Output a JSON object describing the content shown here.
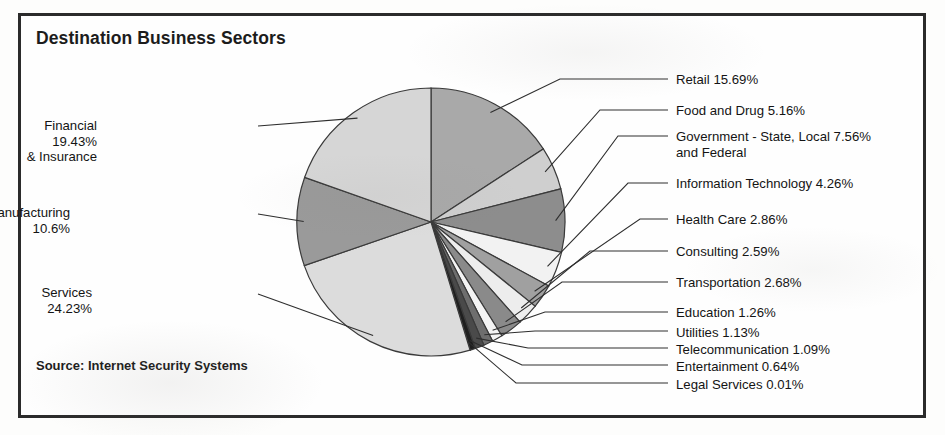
{
  "chart_data": {
    "type": "pie",
    "title": "Destination Business Sectors",
    "source": "Source: Internet Security Systems",
    "unit": "%",
    "start_angle_deg": 0,
    "direction": "clockwise",
    "legend_position": "callout-labels",
    "grid": false,
    "categories": [
      "Retail",
      "Food and Drug",
      "Government - State, Local and Federal",
      "Information Technology",
      "Health Care",
      "Consulting",
      "Transportation",
      "Education",
      "Utilities",
      "Telecommunication",
      "Entertainment",
      "Legal Services",
      "Services",
      "Manufacturing",
      "Financial & Insurance"
    ],
    "values": [
      15.69,
      5.16,
      7.56,
      4.26,
      2.86,
      2.59,
      2.68,
      1.26,
      1.13,
      1.09,
      0.64,
      0.01,
      24.23,
      10.6,
      19.43
    ],
    "slices": [
      {
        "name": "Retail",
        "value": 15.69,
        "label": "Retail 15.69%",
        "color": "#a9a9a9"
      },
      {
        "name": "Food and Drug",
        "value": 5.16,
        "label": "Food and Drug 5.16%",
        "color": "#cfcfcf"
      },
      {
        "name": "Government",
        "value": 7.56,
        "label": "Government - State, Local 7.56%\nand Federal",
        "color": "#8d8d8d"
      },
      {
        "name": "Information Technology",
        "value": 4.26,
        "label": "Information Technology 4.26%",
        "color": "#f2f2f2"
      },
      {
        "name": "Health Care",
        "value": 2.86,
        "label": "Health Care 2.86%",
        "color": "#a0a0a0"
      },
      {
        "name": "Consulting",
        "value": 2.59,
        "label": "Consulting 2.59%",
        "color": "#ededed"
      },
      {
        "name": "Transportation",
        "value": 2.68,
        "label": "Transportation 2.68%",
        "color": "#8a8a8a"
      },
      {
        "name": "Education",
        "value": 1.26,
        "label": "Education 1.26%",
        "color": "#f4f4f4"
      },
      {
        "name": "Utilities",
        "value": 1.13,
        "label": "Utilities 1.13%",
        "color": "#6e6e6e"
      },
      {
        "name": "Telecommunication",
        "value": 1.09,
        "label": "Telecommunication 1.09%",
        "color": "#4a4a4a"
      },
      {
        "name": "Entertainment",
        "value": 0.64,
        "label": "Entertainment 0.64%",
        "color": "#1f1f1f"
      },
      {
        "name": "Legal Services",
        "value": 0.01,
        "label": "Legal Services 0.01%",
        "color": "#101010"
      },
      {
        "name": "Services",
        "value": 24.23,
        "label": "Services 24.23%",
        "color": "#dcdcdc"
      },
      {
        "name": "Manufacturing",
        "value": 10.6,
        "label": "Manufacturing 10.6%",
        "color": "#9a9a9a"
      },
      {
        "name": "Financial & Insurance",
        "value": 19.43,
        "label": "Financial 19.43%\n& Insurance",
        "color": "#d6d6d6"
      }
    ]
  },
  "labels": {
    "left": [
      {
        "name": "financial-insurance",
        "text": "Financial 19.43%\n& Insurance",
        "x": 97,
        "y": 118
      },
      {
        "name": "manufacturing",
        "text": "Manufacturing 10.6%",
        "x": 70,
        "y": 205
      },
      {
        "name": "services",
        "text": "Services 24.23%",
        "x": 92,
        "y": 285
      }
    ],
    "right": [
      {
        "name": "retail",
        "text": "Retail 15.69%",
        "x": 676,
        "y": 72
      },
      {
        "name": "food-and-drug",
        "text": "Food and Drug 5.16%",
        "x": 676,
        "y": 103
      },
      {
        "name": "government",
        "text": "Government - State, Local 7.56%\nand Federal",
        "x": 676,
        "y": 129
      },
      {
        "name": "information-technology",
        "text": "Information Technology 4.26%",
        "x": 676,
        "y": 176
      },
      {
        "name": "health-care",
        "text": "Health Care 2.86%",
        "x": 676,
        "y": 212
      },
      {
        "name": "consulting",
        "text": "Consulting 2.59%",
        "x": 676,
        "y": 244
      },
      {
        "name": "transportation",
        "text": "Transportation 2.68%",
        "x": 676,
        "y": 275
      },
      {
        "name": "education",
        "text": "Education 1.26%",
        "x": 676,
        "y": 305
      },
      {
        "name": "utilities",
        "text": "Utilities 1.13%",
        "x": 676,
        "y": 325
      },
      {
        "name": "telecommunication",
        "text": "Telecommunication 1.09%",
        "x": 676,
        "y": 342
      },
      {
        "name": "entertainment",
        "text": "Entertainment 0.64%",
        "x": 676,
        "y": 359
      },
      {
        "name": "legal-services",
        "text": "Legal Services 0.01%",
        "x": 676,
        "y": 377
      }
    ]
  },
  "geometry": {
    "cx": 431,
    "cy": 222,
    "r": 134,
    "stroke": "#3a3a3a"
  }
}
